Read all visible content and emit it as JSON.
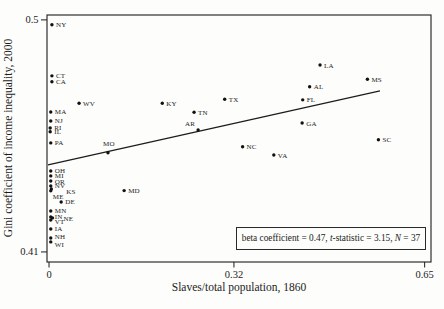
{
  "figure": {
    "background": "#fdfdfb",
    "ink_color": "#1c1c1c"
  },
  "chart_data": {
    "type": "scatter",
    "title": "",
    "xlabel": "Slaves/total population, 1860",
    "ylabel": "Gini coefficient of income inequality, 2000",
    "x_ticks": [
      {
        "v": 0,
        "label": "0"
      },
      {
        "v": 0.32,
        "label": "0.32"
      },
      {
        "v": 0.65,
        "label": "0.65"
      }
    ],
    "y_ticks": [
      {
        "v": 0.5,
        "label": "0.5"
      },
      {
        "v": 0.41,
        "label": "0.41"
      }
    ],
    "axes": {
      "x": {
        "min": -0.0035,
        "max": 0.661
      },
      "y": {
        "min": 0.4061,
        "max": 0.5019
      }
    },
    "grid": false,
    "marker": {
      "radius": 1.7,
      "color": "#111111"
    },
    "points": [
      {
        "s": "NY",
        "x": 0.005,
        "y": 0.4981
      },
      {
        "s": "CT",
        "x": 0.005,
        "y": 0.4783
      },
      {
        "s": "CA",
        "x": 0.005,
        "y": 0.476
      },
      {
        "s": "WV",
        "x": 0.052,
        "y": 0.4677
      },
      {
        "s": "KY",
        "x": 0.196,
        "y": 0.4677
      },
      {
        "s": "TN",
        "x": 0.251,
        "y": 0.4642
      },
      {
        "s": "TX",
        "x": 0.304,
        "y": 0.4692
      },
      {
        "s": "AR",
        "x": 0.258,
        "y": 0.4573,
        "lx": -3,
        "ly": -4,
        "anchor": "end"
      },
      {
        "s": "LA",
        "x": 0.469,
        "y": 0.4825
      },
      {
        "s": "MS",
        "x": 0.551,
        "y": 0.477
      },
      {
        "s": "AL",
        "x": 0.451,
        "y": 0.4741
      },
      {
        "s": "FL",
        "x": 0.439,
        "y": 0.469
      },
      {
        "s": "GA",
        "x": 0.438,
        "y": 0.46
      },
      {
        "s": "NC",
        "x": 0.335,
        "y": 0.4508
      },
      {
        "s": "VA",
        "x": 0.389,
        "y": 0.4476
      },
      {
        "s": "SC",
        "x": 0.57,
        "y": 0.4535
      },
      {
        "s": "MA",
        "x": 0.003,
        "y": 0.4643
      },
      {
        "s": "NJ",
        "x": 0.003,
        "y": 0.4608
      },
      {
        "s": "RI",
        "x": 0.002,
        "y": 0.4581
      },
      {
        "s": "IL",
        "x": 0.002,
        "y": 0.4566
      },
      {
        "s": "PA",
        "x": 0.003,
        "y": 0.4523
      },
      {
        "s": "MO",
        "x": 0.102,
        "y": 0.4485,
        "lx": -5,
        "ly": -7
      },
      {
        "s": "OH",
        "x": 0.003,
        "y": 0.4414
      },
      {
        "s": "MI",
        "x": 0.003,
        "y": 0.4395
      },
      {
        "s": "OR",
        "x": 0.003,
        "y": 0.4375
      },
      {
        "s": "NV",
        "x": 0.003,
        "y": 0.4356
      },
      {
        "s": "KS",
        "x": 0.004,
        "y": 0.4344,
        "lx": 15,
        "ly": 5
      },
      {
        "s": "ME",
        "x": 0.003,
        "y": 0.4337,
        "lx": 2,
        "ly": 8
      },
      {
        "s": "MD",
        "x": 0.13,
        "y": 0.4338
      },
      {
        "s": "DE",
        "x": 0.021,
        "y": 0.4294
      },
      {
        "s": "MN",
        "x": 0.003,
        "y": 0.4259
      },
      {
        "s": "IN",
        "x": 0.003,
        "y": 0.4236
      },
      {
        "s": "NE",
        "x": 0.006,
        "y": 0.4232,
        "lx": 11,
        "ly": 3
      },
      {
        "s": "VT",
        "x": 0.003,
        "y": 0.4224,
        "lx": 4,
        "ly": 4
      },
      {
        "s": "IA",
        "x": 0.003,
        "y": 0.4189
      },
      {
        "s": "NH",
        "x": 0.003,
        "y": 0.4154,
        "lx": 4,
        "ly": 1
      },
      {
        "s": "WI",
        "x": 0.003,
        "y": 0.4139,
        "lx": 4,
        "ly": 5
      }
    ],
    "trend_line": {
      "x1": -0.0017,
      "y1": 0.4438,
      "x2": 0.5727,
      "y2": 0.4725
    },
    "regression_stats": {
      "beta": 0.47,
      "t_statistic": 3.15,
      "n": 37
    },
    "annotation": {
      "full": "beta coefficient = 0.47, t-statistic = 3.15, N = 37",
      "parts": [
        {
          "text": "beta coefficient = 0.47, ",
          "italic": false
        },
        {
          "text": "t",
          "italic": true
        },
        {
          "text": "-statistic = 3.15, ",
          "italic": false
        },
        {
          "text": "N",
          "italic": true
        },
        {
          "text": " = 37",
          "italic": false
        }
      ]
    }
  }
}
